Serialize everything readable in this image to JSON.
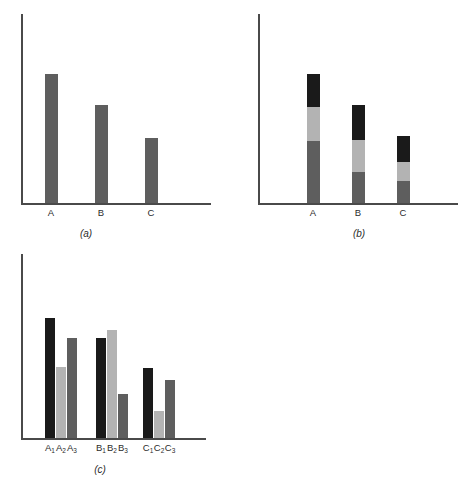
{
  "figure": {
    "background": "#ffffff",
    "axis_color": "#4a4a4a",
    "colors": {
      "black": "#1a1a1a",
      "light_gray": "#b3b3b3",
      "dark_gray": "#5e5e5e"
    }
  },
  "panels": {
    "a": {
      "caption": "(a)",
      "tick_labels": [
        "A",
        "B",
        "C"
      ]
    },
    "b": {
      "caption": "(b)",
      "tick_labels": [
        "A",
        "B",
        "C"
      ]
    },
    "c": {
      "caption": "(c)",
      "tick_labels": [
        {
          "base": "A",
          "sub": "1"
        },
        {
          "base": "A",
          "sub": "2"
        },
        {
          "base": "A",
          "sub": "3"
        },
        {
          "base": "B",
          "sub": "1"
        },
        {
          "base": "B",
          "sub": "2"
        },
        {
          "base": "B",
          "sub": "3"
        },
        {
          "base": "C",
          "sub": "1"
        },
        {
          "base": "C",
          "sub": "2"
        },
        {
          "base": "C",
          "sub": "3"
        }
      ]
    }
  },
  "chart_data": [
    {
      "type": "bar",
      "panel": "a",
      "title": "(a)",
      "xlabel": "",
      "ylabel": "",
      "categories": [
        "A",
        "B",
        "C"
      ],
      "values": [
        100,
        76,
        50
      ],
      "ylim": [
        0,
        115
      ],
      "grid": false,
      "legend": "none",
      "series": [
        {
          "name": "value",
          "color": "#5e5e5e",
          "values": [
            100,
            76,
            50
          ]
        }
      ]
    },
    {
      "type": "bar",
      "subtype": "stacked",
      "panel": "b",
      "title": "(b)",
      "xlabel": "",
      "ylabel": "",
      "categories": [
        "A",
        "B",
        "C"
      ],
      "ylim": [
        0,
        115
      ],
      "grid": false,
      "legend": "none",
      "series": [
        {
          "name": "bottom",
          "color": "#5e5e5e",
          "values": [
            48,
            27,
            17
          ]
        },
        {
          "name": "middle",
          "color": "#b3b3b3",
          "values": [
            26,
            25,
            15
          ]
        },
        {
          "name": "top",
          "color": "#1a1a1a",
          "values": [
            26,
            24,
            18
          ]
        }
      ],
      "totals": [
        100,
        76,
        50
      ]
    },
    {
      "type": "bar",
      "subtype": "grouped",
      "panel": "c",
      "title": "(c)",
      "xlabel": "",
      "ylabel": "",
      "categories": [
        "A",
        "B",
        "C"
      ],
      "ylim": [
        0,
        140
      ],
      "grid": false,
      "legend": "none",
      "series": [
        {
          "name": "1",
          "color": "#1a1a1a",
          "values": [
            100,
            83,
            58
          ]
        },
        {
          "name": "2",
          "color": "#b3b3b3",
          "values": [
            59,
            90,
            23
          ]
        },
        {
          "name": "3",
          "color": "#5e5e5e",
          "values": [
            83,
            37,
            48
          ]
        }
      ]
    }
  ],
  "geometry": {
    "panel_a": {
      "axis_y": {
        "x": 21,
        "y": 14,
        "h": 190
      },
      "axis_x": {
        "x": 21,
        "y": 203,
        "w": 190
      },
      "bars": [
        {
          "name": "bar-a",
          "x": 45,
          "y": 74,
          "w": 13,
          "h": 129,
          "color": "#5e5e5e"
        },
        {
          "name": "bar-b",
          "x": 95,
          "y": 105,
          "w": 13,
          "h": 98,
          "color": "#5e5e5e"
        },
        {
          "name": "bar-c",
          "x": 145,
          "y": 138,
          "w": 13,
          "h": 65,
          "color": "#5e5e5e"
        }
      ],
      "ticks": [
        {
          "label": "A",
          "cx": 51
        },
        {
          "label": "B",
          "cx": 101
        },
        {
          "label": "C",
          "cx": 151
        }
      ],
      "tick_y": 207,
      "caption_pos": {
        "cx": 86,
        "y": 228
      }
    },
    "panel_b": {
      "axis_y": {
        "x": 21,
        "y": 14,
        "h": 190
      },
      "axis_x": {
        "x": 21,
        "y": 203,
        "w": 200
      },
      "bars": [
        {
          "name": "bar-a",
          "x": 70,
          "w": 13,
          "segments": [
            {
              "y": 74,
              "h": 33,
              "color": "#1a1a1a"
            },
            {
              "y": 107,
              "h": 34,
              "color": "#b3b3b3"
            },
            {
              "y": 141,
              "h": 62,
              "color": "#5e5e5e"
            }
          ]
        },
        {
          "name": "bar-b",
          "x": 115,
          "w": 13,
          "segments": [
            {
              "y": 105,
              "h": 35,
              "color": "#1a1a1a"
            },
            {
              "y": 140,
              "h": 32,
              "color": "#b3b3b3"
            },
            {
              "y": 172,
              "h": 31,
              "color": "#5e5e5e"
            }
          ]
        },
        {
          "name": "bar-c",
          "x": 160,
          "w": 13,
          "segments": [
            {
              "y": 136,
              "h": 26,
              "color": "#1a1a1a"
            },
            {
              "y": 162,
              "h": 19,
              "color": "#b3b3b3"
            },
            {
              "y": 181,
              "h": 22,
              "color": "#5e5e5e"
            }
          ]
        }
      ],
      "ticks": [
        {
          "label": "A",
          "cx": 76
        },
        {
          "label": "B",
          "cx": 121
        },
        {
          "label": "C",
          "cx": 166
        }
      ],
      "tick_y": 207,
      "caption_pos": {
        "cx": 122,
        "y": 228
      }
    },
    "panel_c": {
      "axis_y": {
        "x": 21,
        "y": 10,
        "h": 184
      },
      "axis_x": {
        "x": 21,
        "y": 194,
        "w": 185
      },
      "bars": [
        {
          "name": "bar-a1",
          "x": 45,
          "y": 74,
          "w": 10,
          "h": 120,
          "color": "#1a1a1a"
        },
        {
          "name": "bar-a2",
          "x": 56,
          "y": 123,
          "w": 10,
          "h": 71,
          "color": "#b3b3b3"
        },
        {
          "name": "bar-a3",
          "x": 67,
          "y": 94,
          "w": 10,
          "h": 100,
          "color": "#5e5e5e"
        },
        {
          "name": "bar-b1",
          "x": 96,
          "y": 94,
          "w": 10,
          "h": 100,
          "color": "#1a1a1a"
        },
        {
          "name": "bar-b2",
          "x": 107,
          "y": 86,
          "w": 10,
          "h": 108,
          "color": "#b3b3b3"
        },
        {
          "name": "bar-b3",
          "x": 118,
          "y": 150,
          "w": 10,
          "h": 44,
          "color": "#5e5e5e"
        },
        {
          "name": "bar-c1",
          "x": 143,
          "y": 124,
          "w": 10,
          "h": 70,
          "color": "#1a1a1a"
        },
        {
          "name": "bar-c2",
          "x": 154,
          "y": 167,
          "w": 10,
          "h": 27,
          "color": "#b3b3b3"
        },
        {
          "name": "bar-c3",
          "x": 165,
          "y": 136,
          "w": 10,
          "h": 58,
          "color": "#5e5e5e"
        }
      ],
      "ticks": [
        {
          "cx": 50
        },
        {
          "cx": 61
        },
        {
          "cx": 72
        },
        {
          "cx": 101
        },
        {
          "cx": 112
        },
        {
          "cx": 123
        },
        {
          "cx": 148
        },
        {
          "cx": 159
        },
        {
          "cx": 170
        }
      ],
      "tick_y": 198,
      "caption_pos": {
        "cx": 100,
        "y": 220
      }
    }
  }
}
